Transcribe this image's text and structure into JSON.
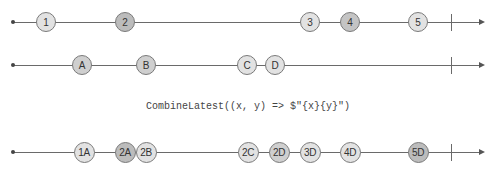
{
  "diagram": {
    "type": "marble",
    "operator_label": "CombineLatest((x, y) => $\"{x}{y}\")",
    "colors": {
      "line": "#6a6a6a",
      "light": "#e2e2e2",
      "medium": "#cfcfcf",
      "dark": "#b8b8b8"
    },
    "timelines": [
      {
        "name": "source-x",
        "y": 8,
        "marbles": [
          {
            "label": "1",
            "x": 46,
            "shade": "#e2e2e2"
          },
          {
            "label": "2",
            "x": 125,
            "shade": "#bcbcbc"
          },
          {
            "label": "3",
            "x": 310,
            "shade": "#e2e2e2"
          },
          {
            "label": "4",
            "x": 350,
            "shade": "#c4c4c4"
          },
          {
            "label": "5",
            "x": 418,
            "shade": "#e2e2e2"
          }
        ]
      },
      {
        "name": "source-y",
        "y": 51,
        "marbles": [
          {
            "label": "A",
            "x": 82,
            "shade": "#cfcfcf"
          },
          {
            "label": "B",
            "x": 146,
            "shade": "#cfcfcf"
          },
          {
            "label": "C",
            "x": 247,
            "shade": "#e2e2e2"
          },
          {
            "label": "D",
            "x": 275,
            "shade": "#e2e2e2"
          }
        ]
      },
      {
        "name": "result",
        "y": 138,
        "marbles": [
          {
            "label": "1A",
            "x": 84,
            "shade": "#e2e2e2"
          },
          {
            "label": "2A",
            "x": 125,
            "shade": "#bcbcbc"
          },
          {
            "label": "2B",
            "x": 146,
            "shade": "#e2e2e2"
          },
          {
            "label": "2C",
            "x": 248,
            "shade": "#e2e2e2"
          },
          {
            "label": "2D",
            "x": 279,
            "shade": "#cfcfcf"
          },
          {
            "label": "3D",
            "x": 310,
            "shade": "#e2e2e2"
          },
          {
            "label": "4D",
            "x": 350,
            "shade": "#e2e2e2"
          },
          {
            "label": "5D",
            "x": 418,
            "shade": "#bcbcbc"
          }
        ]
      }
    ]
  }
}
